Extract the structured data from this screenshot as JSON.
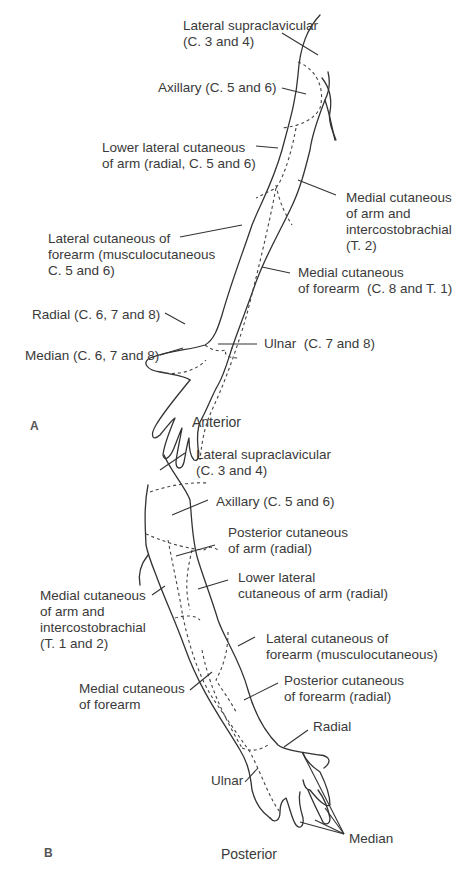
{
  "figure": {
    "panels": [
      {
        "id": "A",
        "panel_label": "A",
        "view_label": "Anterior",
        "labels": [
          {
            "key": "lateral_supraclavicular",
            "text": "Lateral supraclavicular\n(C. 3 and 4)"
          },
          {
            "key": "axillary",
            "text": "Axillary (C. 5 and 6)"
          },
          {
            "key": "lower_lateral_cutaneous_arm",
            "text": "Lower lateral cutaneous\nof arm (radial, C. 5 and 6)"
          },
          {
            "key": "medial_cutaneous_arm_intercostobrachial",
            "text": "Medial cutaneous\nof arm and\nintercostobrachial\n(T. 2)"
          },
          {
            "key": "lateral_cutaneous_forearm",
            "text": "Lateral cutaneous of\nforearm (musculocutaneous\nC. 5 and 6)"
          },
          {
            "key": "medial_cutaneous_forearm",
            "text": "Medial cutaneous\nof forearm  (C. 8 and T. 1)"
          },
          {
            "key": "radial",
            "text": "Radial (C. 6, 7 and 8)"
          },
          {
            "key": "median",
            "text": "Median (C. 6, 7 and 8)"
          },
          {
            "key": "ulnar",
            "text": "Ulnar  (C. 7 and 8)"
          }
        ]
      },
      {
        "id": "B",
        "panel_label": "B",
        "view_label": "Posterior",
        "labels": [
          {
            "key": "lateral_supraclavicular",
            "text": "Lateral supraclavicular\n(C. 3 and 4)"
          },
          {
            "key": "axillary",
            "text": "Axillary (C. 5 and 6)"
          },
          {
            "key": "posterior_cutaneous_arm",
            "text": "Posterior cutaneous\nof arm (radial)"
          },
          {
            "key": "lower_lateral_cutaneous_arm",
            "text": "Lower lateral\ncutaneous of arm (radial)"
          },
          {
            "key": "medial_cutaneous_arm_intercostobrachial",
            "text": "Medial cutaneous\nof arm and\nintercostobrachial\n(T. 1 and 2)"
          },
          {
            "key": "lateral_cutaneous_forearm",
            "text": "Lateral cutaneous of\nforearm (musculocutaneous)"
          },
          {
            "key": "medial_cutaneous_forearm",
            "text": "Medial cutaneous\nof forearm"
          },
          {
            "key": "posterior_cutaneous_forearm",
            "text": "Posterior cutaneous\nof forearm (radial)"
          },
          {
            "key": "radial",
            "text": "Radial"
          },
          {
            "key": "ulnar",
            "text": "Ulnar"
          },
          {
            "key": "median",
            "text": "Median"
          }
        ]
      }
    ]
  }
}
